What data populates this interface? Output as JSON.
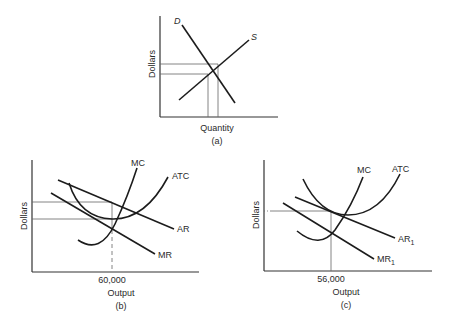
{
  "figure": {
    "panels": [
      {
        "id": "a",
        "caption": "(a)",
        "xlabel": "Quantity",
        "ylabel": "Dollars",
        "curves": [
          {
            "name": "demand",
            "label": "D"
          },
          {
            "name": "supply",
            "label": "S"
          }
        ]
      },
      {
        "id": "b",
        "caption": "(b)",
        "xlabel": "Output",
        "ylabel": "Dollars",
        "x_tick": "60,000",
        "curves": [
          {
            "name": "marginal-cost",
            "label": "MC"
          },
          {
            "name": "average-total-cost",
            "label": "ATC"
          },
          {
            "name": "average-revenue",
            "label": "AR"
          },
          {
            "name": "marginal-revenue",
            "label": "MR"
          }
        ]
      },
      {
        "id": "c",
        "caption": "(c)",
        "xlabel": "Output",
        "ylabel": "Dollars",
        "x_tick": "56,000",
        "curves": [
          {
            "name": "marginal-cost",
            "label": "MC"
          },
          {
            "name": "average-total-cost",
            "label": "ATC"
          },
          {
            "name": "average-revenue",
            "label": "AR",
            "subscript": "1"
          },
          {
            "name": "marginal-revenue",
            "label": "MR",
            "subscript": "1"
          }
        ]
      }
    ]
  }
}
